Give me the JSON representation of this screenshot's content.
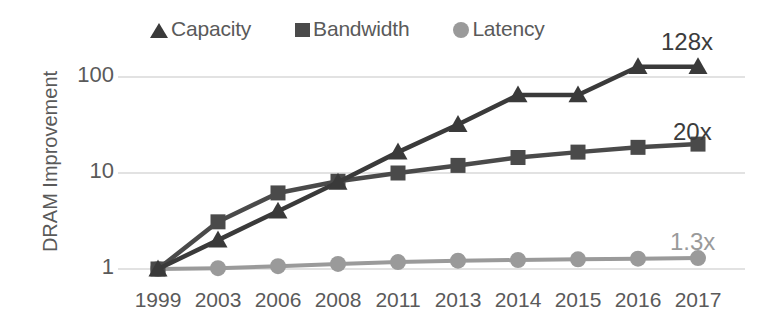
{
  "chart_data": {
    "type": "line",
    "title": "",
    "xlabel": "",
    "ylabel": "DRAM Improvement",
    "yscale": "log",
    "ylim": [
      1,
      200
    ],
    "yticks": [
      "1",
      "10",
      "100"
    ],
    "ytick_values": [
      1,
      10,
      100
    ],
    "grid": true,
    "legend_position": "top-center",
    "categories": [
      "1999",
      "2003",
      "2006",
      "2008",
      "2011",
      "2013",
      "2014",
      "2015",
      "2016",
      "2017"
    ],
    "series": [
      {
        "name": "Capacity",
        "marker": "triangle",
        "color": "#3a3a3a",
        "values": [
          1,
          2,
          4,
          8,
          16.5,
          32,
          65,
          65,
          128,
          128
        ],
        "end_label": "128x"
      },
      {
        "name": "Bandwidth",
        "marker": "square",
        "color": "#4a4a4a",
        "values": [
          1,
          3.1,
          6.2,
          8.2,
          10,
          12,
          14.5,
          16.5,
          18.5,
          20
        ],
        "end_label": "20x"
      },
      {
        "name": "Latency",
        "marker": "circle",
        "color": "#9a9a9a",
        "values": [
          1,
          1.02,
          1.07,
          1.13,
          1.18,
          1.22,
          1.24,
          1.26,
          1.28,
          1.3
        ],
        "end_label": "1.3x"
      }
    ],
    "annotations": [
      {
        "text": "128x",
        "series": "Capacity"
      },
      {
        "text": "20x",
        "series": "Bandwidth"
      },
      {
        "text": "1.3x",
        "series": "Latency"
      }
    ]
  },
  "legend": {
    "items": [
      {
        "label": "Capacity",
        "marker": "triangle-marker-icon"
      },
      {
        "label": "Bandwidth",
        "marker": "square-marker-icon"
      },
      {
        "label": "Latency",
        "marker": "circle-marker-icon"
      }
    ]
  },
  "axes": {
    "y_title": "DRAM Improvement",
    "y_ticks": [
      "100",
      "10",
      "1"
    ],
    "x_ticks": [
      "1999",
      "2003",
      "2006",
      "2008",
      "2011",
      "2013",
      "2014",
      "2015",
      "2016",
      "2017"
    ]
  },
  "annotations": {
    "capacity_end": "128x",
    "bandwidth_end": "20x",
    "latency_end": "1.3x"
  },
  "colors": {
    "capacity": "#3a3a3a",
    "bandwidth": "#4a4a4a",
    "latency": "#9a9a9a",
    "text": "#5a5a5a",
    "grid": "#e2e2e2"
  }
}
